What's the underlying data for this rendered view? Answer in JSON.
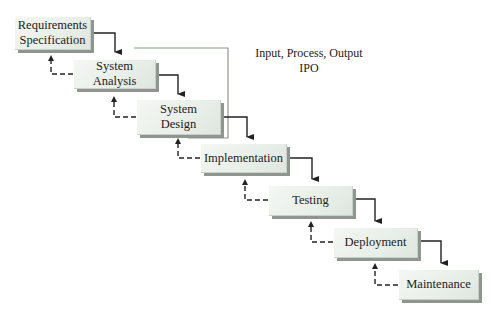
{
  "diagram": {
    "type": "waterfall-model",
    "phases": [
      {
        "id": "requirements",
        "label": "Requirements\nSpecification"
      },
      {
        "id": "analysis",
        "label": "System Analysis"
      },
      {
        "id": "design",
        "label": "System\nDesign"
      },
      {
        "id": "implementation",
        "label": "Implementation"
      },
      {
        "id": "testing",
        "label": "Testing"
      },
      {
        "id": "deployment",
        "label": "Deployment"
      },
      {
        "id": "maintenance",
        "label": "Maintenance"
      }
    ],
    "annotation": {
      "line1": "Input, Process, Output",
      "line2": "IPO"
    },
    "colors": {
      "box_fill": "#eef2ee",
      "box_shadow": "#8f968f",
      "arrow": "#222222",
      "bracket": "#8a9a8a"
    }
  }
}
